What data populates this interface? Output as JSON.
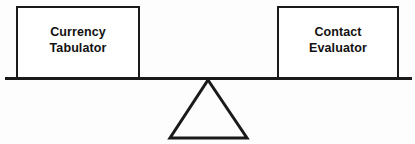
{
  "diagram": {
    "type": "balance-scale",
    "beam": {
      "name": "balance-beam",
      "color": "#1a1a1a",
      "thickness_px": 3,
      "x_start": 5,
      "x_end": 412,
      "y": 78
    },
    "fulcrum": {
      "name": "fulcrum-triangle",
      "shape": "triangle",
      "color": "#1a1a1a",
      "apex_x": 208,
      "apex_y": 80,
      "base_left_x": 170,
      "base_right_x": 247,
      "base_y": 138
    },
    "pans": [
      {
        "id": "left",
        "name": "left-pan",
        "label": "Currency\nTabulator",
        "line1": "Currency",
        "line2": "Tabulator",
        "border_color": "#1a1a1a",
        "fill_color": "#ffffff"
      },
      {
        "id": "right",
        "name": "right-pan",
        "label": "Contact\nEvaluator",
        "line1": "Contact",
        "line2": "Evaluator",
        "border_color": "#1a1a1a",
        "fill_color": "#ffffff"
      }
    ],
    "background_color": "#fdfdfd",
    "text_color": "#111111"
  }
}
